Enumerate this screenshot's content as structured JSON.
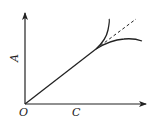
{
  "diagram": {
    "type": "curve-branching-diagram",
    "axes": {
      "origin_label": "O",
      "x_label": "C",
      "y_label": "A"
    },
    "curves": [
      {
        "name": "linear-segment",
        "style": "solid",
        "from": "origin",
        "to": "branch-point"
      },
      {
        "name": "upper-branch",
        "style": "solid",
        "description": "curves upward, steeper than linear"
      },
      {
        "name": "linear-extrapolation",
        "style": "dashed",
        "description": "continuation of the linear trend"
      },
      {
        "name": "lower-branch",
        "style": "solid",
        "description": "curves downward, flattening"
      }
    ],
    "colors": {
      "line": "#222222",
      "background": "#ffffff"
    }
  }
}
